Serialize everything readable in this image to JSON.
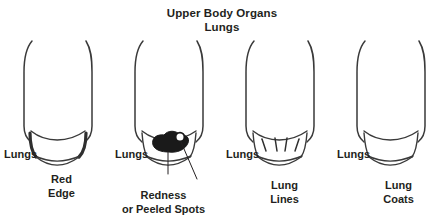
{
  "title": {
    "line1": "Upper Body Organs",
    "line2": "Lungs"
  },
  "panels": [
    {
      "id": "red-edge",
      "organ_label": "Lungs",
      "caption_line1": "Red",
      "caption_line2": "Edge",
      "finding": "Red Edge",
      "marking": "thickened-darkened-bowl-edge"
    },
    {
      "id": "redness-peeled-spots",
      "organ_label": "Lungs",
      "caption_line1": "Redness",
      "caption_line2": "or Peeled Spots",
      "finding": "Redness or Peeled Spots",
      "marking": "solid-black-blob-with-white-ring"
    },
    {
      "id": "lung-lines",
      "organ_label": "Lungs",
      "caption_line1": "Lung",
      "caption_line2": "Lines",
      "finding": "Lung Lines",
      "marking": "four-short-diagonal-strokes"
    },
    {
      "id": "lung-coats",
      "organ_label": "Lungs",
      "caption_line1": "Lung",
      "caption_line2": "Coats",
      "finding": "Lung Coats",
      "marking": "plain-double-arc-bowl"
    }
  ],
  "colors": {
    "background": "#ffffff",
    "ink": "#231f20",
    "stroke": "#3a3a3a",
    "blob": "#1a1a1a"
  }
}
